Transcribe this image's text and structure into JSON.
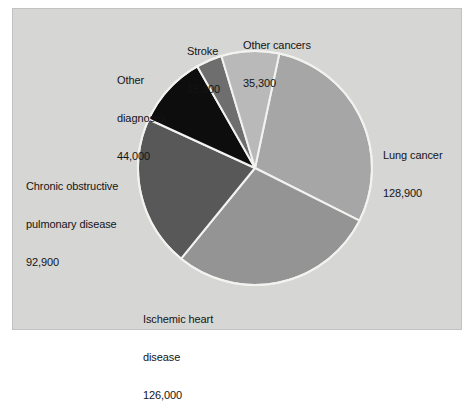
{
  "figure": {
    "background_color": "#ffffff",
    "panel_color": "#d6d6d4",
    "panel_border_color": "#c2c2c0",
    "slice_divider_color": "#f2f2f0"
  },
  "chart_data": {
    "type": "pie",
    "title": "",
    "subtitle": "",
    "xlabel": "",
    "ylabel": "",
    "legend_position": "none",
    "grid": false,
    "total": 443000,
    "start_angle_deg": 12,
    "direction": "clockwise",
    "categories": [
      "Lung cancer",
      "Ischemic heart disease",
      "Chronic obstructive pulmonary disease",
      "Other diagnoses",
      "Stroke",
      "Other cancers"
    ],
    "values": [
      128900,
      126000,
      92900,
      44000,
      15900,
      35300
    ],
    "value_labels": [
      "128,900",
      "126,000",
      "92,900",
      "44,000",
      "15,900",
      "35,300"
    ],
    "colors": [
      "#a6a6a6",
      "#949494",
      "#585858",
      "#0d0d0d",
      "#6e6e6e",
      "#b9b9b9"
    ],
    "slices": [
      {
        "name": "Lung cancer",
        "label_line1": "Lung cancer",
        "label_line2": "",
        "value": 128900,
        "value_label": "128,900",
        "color": "#a6a6a6",
        "angle_deg": 104.8
      },
      {
        "name": "Ischemic heart disease",
        "label_line1": "Ischemic heart",
        "label_line2": "disease",
        "value": 126000,
        "value_label": "126,000",
        "color": "#949494",
        "angle_deg": 102.4
      },
      {
        "name": "Chronic obstructive pulmonary disease",
        "label_line1": "Chronic obstructive",
        "label_line2": "pulmonary disease",
        "value": 92900,
        "value_label": "92,900",
        "color": "#585858",
        "angle_deg": 75.5
      },
      {
        "name": "Other diagnoses",
        "label_line1": "Other",
        "label_line2": "diagnoses",
        "value": 44000,
        "value_label": "44,000",
        "color": "#0d0d0d",
        "angle_deg": 35.8
      },
      {
        "name": "Stroke",
        "label_line1": "Stroke",
        "label_line2": "",
        "value": 15900,
        "value_label": "15,900",
        "color": "#6e6e6e",
        "angle_deg": 12.9
      },
      {
        "name": "Other cancers",
        "label_line1": "Other cancers",
        "label_line2": "",
        "value": 35300,
        "value_label": "35,300",
        "color": "#b9b9b9",
        "angle_deg": 28.7
      }
    ]
  }
}
